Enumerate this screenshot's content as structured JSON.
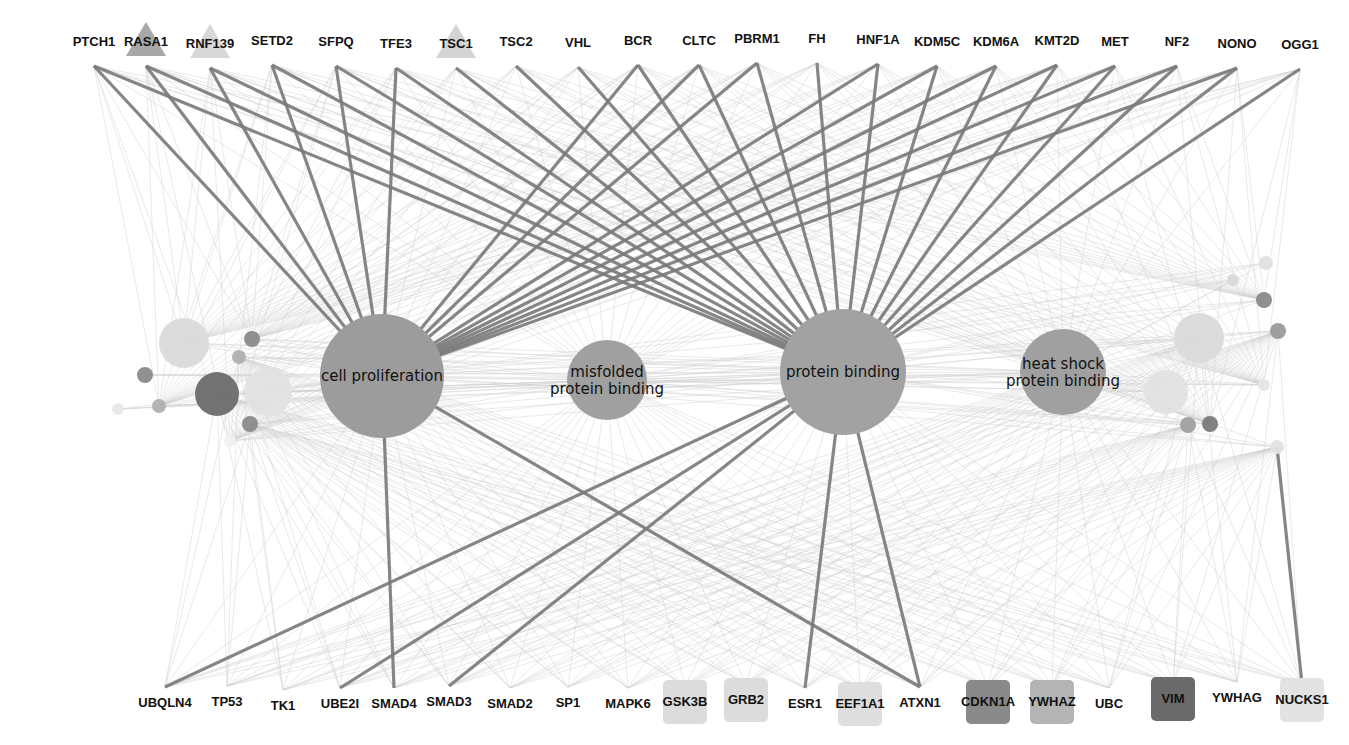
{
  "diagram": {
    "type": "gene-ontology-network",
    "colors": {
      "background": "#ffffff",
      "hub_fill": "#9a9a9a",
      "strong_edge": "#7a7a7a",
      "faint_edge": "#d0d0d0",
      "label": "#111111"
    },
    "hubs": [
      {
        "id": "cell-proliferation",
        "lines": [
          "cell proliferation"
        ],
        "x": 382,
        "y": 376,
        "r": 62,
        "fill": "#9c9c9c"
      },
      {
        "id": "misfolded-protein-binding",
        "lines": [
          "misfolded",
          "protein binding"
        ],
        "x": 607,
        "y": 380,
        "r": 40,
        "fill": "#a0a0a0"
      },
      {
        "id": "protein-binding",
        "lines": [
          "protein binding"
        ],
        "x": 843,
        "y": 372,
        "r": 63,
        "fill": "#a2a2a2"
      },
      {
        "id": "heat-shock-protein-binding",
        "lines": [
          "heat shock",
          "protein binding"
        ],
        "x": 1063,
        "y": 372,
        "r": 43,
        "fill": "#a0a0a0"
      }
    ],
    "top_genes": [
      {
        "label": "PTCH1",
        "x": 94,
        "y": 48,
        "shape": "none"
      },
      {
        "label": "RASA1",
        "x": 146,
        "y": 48,
        "shape": "triangle",
        "fill": "#a8a8a8"
      },
      {
        "label": "RNF139",
        "x": 210,
        "y": 50,
        "shape": "triangle",
        "fill": "#d8d8d8"
      },
      {
        "label": "SETD2",
        "x": 272,
        "y": 47,
        "shape": "none"
      },
      {
        "label": "SFPQ",
        "x": 336,
        "y": 48,
        "shape": "none"
      },
      {
        "label": "TFE3",
        "x": 396,
        "y": 50,
        "shape": "none"
      },
      {
        "label": "TSC1",
        "x": 456,
        "y": 50,
        "shape": "triangle",
        "fill": "#d4d4d4"
      },
      {
        "label": "TSC2",
        "x": 516,
        "y": 48,
        "shape": "none"
      },
      {
        "label": "VHL",
        "x": 578,
        "y": 49,
        "shape": "none"
      },
      {
        "label": "BCR",
        "x": 638,
        "y": 47,
        "shape": "none"
      },
      {
        "label": "CLTC",
        "x": 699,
        "y": 47,
        "shape": "none"
      },
      {
        "label": "PBRM1",
        "x": 757,
        "y": 45,
        "shape": "none"
      },
      {
        "label": "FH",
        "x": 817,
        "y": 45,
        "shape": "none"
      },
      {
        "label": "HNF1A",
        "x": 878,
        "y": 46,
        "shape": "none"
      },
      {
        "label": "KDM5C",
        "x": 937,
        "y": 48,
        "shape": "none"
      },
      {
        "label": "KDM6A",
        "x": 996,
        "y": 48,
        "shape": "none"
      },
      {
        "label": "KMT2D",
        "x": 1057,
        "y": 47,
        "shape": "none"
      },
      {
        "label": "MET",
        "x": 1115,
        "y": 48,
        "shape": "none"
      },
      {
        "label": "NF2",
        "x": 1177,
        "y": 48,
        "shape": "none"
      },
      {
        "label": "NONO",
        "x": 1237,
        "y": 50,
        "shape": "none"
      },
      {
        "label": "OGG1",
        "x": 1300,
        "y": 51,
        "shape": "none"
      }
    ],
    "bottom_genes": [
      {
        "label": "UBQLN4",
        "x": 165,
        "y": 703,
        "box": null
      },
      {
        "label": "TP53",
        "x": 227,
        "y": 702,
        "box": null
      },
      {
        "label": "TK1",
        "x": 283,
        "y": 706,
        "box": null
      },
      {
        "label": "UBE2I",
        "x": 340,
        "y": 704,
        "box": null
      },
      {
        "label": "SMAD4",
        "x": 394,
        "y": 704,
        "box": null
      },
      {
        "label": "SMAD3",
        "x": 449,
        "y": 702,
        "box": null
      },
      {
        "label": "SMAD2",
        "x": 510,
        "y": 704,
        "box": null
      },
      {
        "label": "SP1",
        "x": 568,
        "y": 703,
        "box": null
      },
      {
        "label": "MAPK6",
        "x": 628,
        "y": 704,
        "box": null
      },
      {
        "label": "GSK3B",
        "x": 685,
        "y": 702,
        "box": "#dcdcdc"
      },
      {
        "label": "GRB2",
        "x": 746,
        "y": 700,
        "box": "#dcdcdc"
      },
      {
        "label": "ESR1",
        "x": 805,
        "y": 704,
        "box": null
      },
      {
        "label": "EEF1A1",
        "x": 860,
        "y": 704,
        "box": "#dedede"
      },
      {
        "label": "ATXN1",
        "x": 920,
        "y": 703,
        "box": null
      },
      {
        "label": "CDKN1A",
        "x": 988,
        "y": 702,
        "box": "#8a8a8a"
      },
      {
        "label": "YWHAZ",
        "x": 1052,
        "y": 702,
        "box": "#b4b4b4"
      },
      {
        "label": "UBC",
        "x": 1109,
        "y": 704,
        "box": null
      },
      {
        "label": "VIM",
        "x": 1173,
        "y": 699,
        "box": "#6a6a6a"
      },
      {
        "label": "YWHAG",
        "x": 1237,
        "y": 698,
        "box": null
      },
      {
        "label": "NUCKS1",
        "x": 1302,
        "y": 700,
        "box": "#e2e2e2"
      }
    ],
    "side_nodes": [
      {
        "x": 184,
        "y": 343,
        "r": 25,
        "fill": "#dadada"
      },
      {
        "x": 217,
        "y": 394,
        "r": 22,
        "fill": "#6c6c6c"
      },
      {
        "x": 268,
        "y": 392,
        "r": 24,
        "fill": "#e2e2e2"
      },
      {
        "x": 252,
        "y": 339,
        "r": 8,
        "fill": "#8a8a8a"
      },
      {
        "x": 239,
        "y": 357,
        "r": 7,
        "fill": "#b0b0b0"
      },
      {
        "x": 145,
        "y": 375,
        "r": 8,
        "fill": "#8a8a8a"
      },
      {
        "x": 159,
        "y": 406,
        "r": 7,
        "fill": "#b0b0b0"
      },
      {
        "x": 250,
        "y": 424,
        "r": 8,
        "fill": "#8a8a8a"
      },
      {
        "x": 118,
        "y": 409,
        "r": 6,
        "fill": "#e8e8e8"
      },
      {
        "x": 230,
        "y": 441,
        "r": 6,
        "fill": "#f0f0f0"
      },
      {
        "x": 1199,
        "y": 338,
        "r": 25,
        "fill": "#dadada"
      },
      {
        "x": 1166,
        "y": 392,
        "r": 22,
        "fill": "#e2e2e2"
      },
      {
        "x": 1264,
        "y": 300,
        "r": 8,
        "fill": "#8a8a8a"
      },
      {
        "x": 1278,
        "y": 331,
        "r": 8,
        "fill": "#9a9a9a"
      },
      {
        "x": 1266,
        "y": 263,
        "r": 7,
        "fill": "#e0e0e0"
      },
      {
        "x": 1210,
        "y": 424,
        "r": 8,
        "fill": "#7a7a7a"
      },
      {
        "x": 1188,
        "y": 425,
        "r": 8,
        "fill": "#a0a0a0"
      },
      {
        "x": 1233,
        "y": 280,
        "r": 6,
        "fill": "#d8d8d8"
      },
      {
        "x": 1264,
        "y": 385,
        "r": 6,
        "fill": "#e6e6e6"
      },
      {
        "x": 1277,
        "y": 447,
        "r": 7,
        "fill": "#e2e2e2"
      }
    ],
    "strong_edges": [
      {
        "from": "top:PTCH1",
        "to": "hub:cell-proliferation"
      },
      {
        "from": "top:RASA1",
        "to": "hub:cell-proliferation"
      },
      {
        "from": "top:RNF139",
        "to": "hub:cell-proliferation"
      },
      {
        "from": "top:SETD2",
        "to": "hub:cell-proliferation"
      },
      {
        "from": "top:SFPQ",
        "to": "hub:cell-proliferation"
      },
      {
        "from": "top:TFE3",
        "to": "hub:cell-proliferation"
      },
      {
        "from": "top:BCR",
        "to": "hub:cell-proliferation"
      },
      {
        "from": "top:CLTC",
        "to": "hub:cell-proliferation"
      },
      {
        "from": "top:PBRM1",
        "to": "hub:cell-proliferation"
      },
      {
        "from": "top:HNF1A",
        "to": "hub:cell-proliferation"
      },
      {
        "from": "top:KDM5C",
        "to": "hub:cell-proliferation"
      },
      {
        "from": "top:KDM6A",
        "to": "hub:cell-proliferation"
      },
      {
        "from": "top:KMT2D",
        "to": "hub:cell-proliferation"
      },
      {
        "from": "top:MET",
        "to": "hub:cell-proliferation"
      },
      {
        "from": "top:NF2",
        "to": "hub:cell-proliferation"
      },
      {
        "from": "top:NONO",
        "to": "hub:cell-proliferation"
      },
      {
        "from": "top:PTCH1",
        "to": "hub:protein-binding"
      },
      {
        "from": "top:RASA1",
        "to": "hub:protein-binding"
      },
      {
        "from": "top:RNF139",
        "to": "hub:protein-binding"
      },
      {
        "from": "top:SETD2",
        "to": "hub:protein-binding"
      },
      {
        "from": "top:SFPQ",
        "to": "hub:protein-binding"
      },
      {
        "from": "top:TFE3",
        "to": "hub:protein-binding"
      },
      {
        "from": "top:TSC1",
        "to": "hub:protein-binding"
      },
      {
        "from": "top:TSC2",
        "to": "hub:protein-binding"
      },
      {
        "from": "top:VHL",
        "to": "hub:protein-binding"
      },
      {
        "from": "top:BCR",
        "to": "hub:protein-binding"
      },
      {
        "from": "top:CLTC",
        "to": "hub:protein-binding"
      },
      {
        "from": "top:PBRM1",
        "to": "hub:protein-binding"
      },
      {
        "from": "top:FH",
        "to": "hub:protein-binding"
      },
      {
        "from": "top:HNF1A",
        "to": "hub:protein-binding"
      },
      {
        "from": "top:KDM5C",
        "to": "hub:protein-binding"
      },
      {
        "from": "top:KDM6A",
        "to": "hub:protein-binding"
      },
      {
        "from": "top:KMT2D",
        "to": "hub:protein-binding"
      },
      {
        "from": "top:MET",
        "to": "hub:protein-binding"
      },
      {
        "from": "top:NF2",
        "to": "hub:protein-binding"
      },
      {
        "from": "top:NONO",
        "to": "hub:protein-binding"
      },
      {
        "from": "top:OGG1",
        "to": "hub:protein-binding"
      },
      {
        "from": "hub:cell-proliferation",
        "to": "bottom:SMAD4"
      },
      {
        "from": "hub:cell-proliferation",
        "to": "bottom:ATXN1"
      },
      {
        "from": "hub:protein-binding",
        "to": "bottom:UBQLN4"
      },
      {
        "from": "hub:protein-binding",
        "to": "bottom:UBE2I"
      },
      {
        "from": "hub:protein-binding",
        "to": "bottom:SMAD3"
      },
      {
        "from": "hub:protein-binding",
        "to": "bottom:ESR1"
      },
      {
        "from": "hub:protein-binding",
        "to": "bottom:ATXN1"
      },
      {
        "from": "side:19",
        "to": "bottom:NUCKS1"
      }
    ]
  }
}
